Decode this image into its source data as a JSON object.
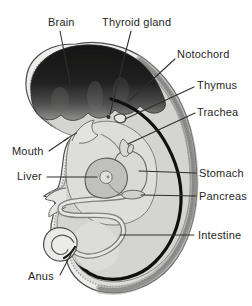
{
  "figure": {
    "labels": {
      "brain": "Brain",
      "thyroid_gland": "Thyroid gland",
      "notochord": "Notochord",
      "thymus": "Thymus",
      "trachea": "Trachea",
      "mouth": "Mouth",
      "liver": "Liver",
      "stomach": "Stomach",
      "pancreas": "Pancreas",
      "intestine": "Intestine",
      "anus": "Anus"
    }
  },
  "palette": {
    "background": "#ffffff",
    "label_ink": "#1f1f1f",
    "leader_line": "#2e2e2c",
    "notochord_band": "#101010",
    "body_fill": "#ededeb",
    "brain_dark": "#121212"
  }
}
